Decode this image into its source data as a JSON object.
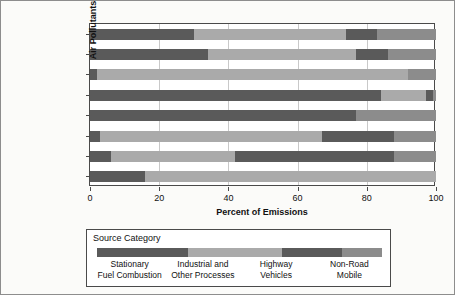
{
  "chart_data": {
    "type": "bar",
    "orientation": "horizontal",
    "stacked": true,
    "stack_mode": "percent",
    "title": "",
    "xlabel": "Percent of Emissions",
    "ylabel": "Air Pollutants",
    "xlim": [
      0,
      100
    ],
    "xticks": [
      0,
      20,
      40,
      60,
      80,
      100
    ],
    "xtick_labels": [
      "0",
      "20",
      "40",
      "60",
      "80",
      "100"
    ],
    "grid": "vertical",
    "legend_position": "below-plot",
    "categories": [
      "Direct PM2.5",
      "Direct PM10",
      "NH3",
      "SO2",
      "NOx",
      "VOC",
      "CO",
      "Lead"
    ],
    "category_labels_html": [
      "Direct PM<sub>2.5</sub>",
      "Direct PM<sub>10</sub>",
      "NH<sub>3</sub>",
      "SO<sub>2</sub>",
      "NO<sub>x</sub>",
      "VOC",
      "CO",
      "Lead"
    ],
    "series": [
      {
        "name": "Stationary Fuel Combustion",
        "color": "#5a5a5a",
        "values": [
          30,
          34,
          2,
          84,
          44,
          3,
          6,
          16
        ]
      },
      {
        "name": "Industrial and Other Processes",
        "color": "#aaaaaa",
        "values": [
          44,
          43,
          90,
          13,
          0,
          64,
          36,
          84
        ]
      },
      {
        "name": "Highway Vehicles",
        "color": "#5a5a5a",
        "values": [
          9,
          9,
          0,
          2,
          33,
          21,
          46,
          0
        ]
      },
      {
        "name": "Non-Road Mobile",
        "color": "#8c8c8c",
        "values": [
          17,
          14,
          8,
          1,
          23,
          12,
          12,
          0
        ]
      }
    ]
  },
  "legend": {
    "title": "Source Category",
    "entries": [
      {
        "label_line1": "Stationary",
        "label_line2": "Fuel Combustion",
        "color": "#5a5a5a"
      },
      {
        "label_line1": "Industrial and",
        "label_line2": "Other Processes",
        "color": "#aaaaaa"
      },
      {
        "label_line1": "Highway",
        "label_line2": "Vehicles",
        "color": "#5a5a5a"
      },
      {
        "label_line1": "Non-Road",
        "label_line2": "Mobile",
        "color": "#8c8c8c"
      }
    ]
  },
  "colors": {
    "frame": "#4a4a4a",
    "gridline": "#c9c9c9",
    "background": "#fbfbf9",
    "plot_background": "#ffffff",
    "text": "#111111"
  }
}
